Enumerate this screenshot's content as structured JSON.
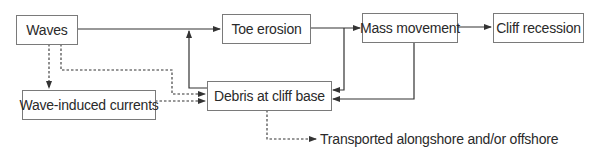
{
  "diagram": {
    "type": "flowchart",
    "title": "",
    "nodes": [
      {
        "id": "waves",
        "label": "Waves"
      },
      {
        "id": "toe_erosion",
        "label": "Toe erosion"
      },
      {
        "id": "mass_movement",
        "label": "Mass movement"
      },
      {
        "id": "cliff_recession",
        "label": "Cliff recession"
      },
      {
        "id": "wave_induced_currents",
        "label": "Wave-induced currents"
      },
      {
        "id": "debris",
        "label": "Debris at cliff base"
      }
    ],
    "edges": [
      {
        "from": "waves",
        "to": "toe_erosion",
        "style": "solid"
      },
      {
        "from": "toe_erosion",
        "to": "mass_movement",
        "style": "solid"
      },
      {
        "from": "mass_movement",
        "to": "cliff_recession",
        "style": "solid"
      },
      {
        "from": "debris",
        "to": "toe_erosion",
        "style": "solid",
        "note": "joins Waves→Toe erosion line"
      },
      {
        "from": "toe_erosion",
        "to": "debris",
        "style": "solid"
      },
      {
        "from": "mass_movement",
        "to": "debris",
        "style": "solid"
      },
      {
        "from": "waves",
        "to": "wave_induced_currents",
        "style": "dashed"
      },
      {
        "from": "waves",
        "to": "debris",
        "style": "dashed"
      },
      {
        "from": "wave_induced_currents",
        "to": "debris",
        "style": "dashed"
      },
      {
        "from": "debris",
        "to": "transported",
        "style": "dashed"
      }
    ],
    "output_label": "Transported alongshore and/or offshore",
    "colors": {
      "line": "#333333",
      "border": "#7a7a7a",
      "text": "#2a2a2a"
    }
  }
}
